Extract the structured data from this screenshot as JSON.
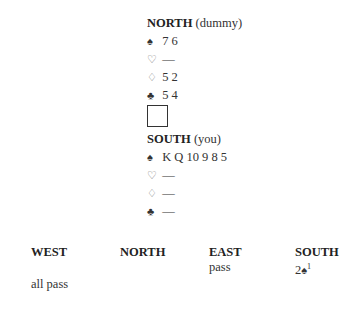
{
  "north": {
    "label": "NORTH",
    "note": "(dummy)",
    "spades": "7 6",
    "hearts": "—",
    "diamonds": "5 2",
    "clubs": "5 4"
  },
  "south": {
    "label": "SOUTH",
    "note": "(you)",
    "spades": "K Q 10 9 8 5",
    "hearts": "—",
    "diamonds": "—",
    "clubs": "—"
  },
  "suits": {
    "spade": "♠",
    "heart": "♡",
    "diamond": "♢",
    "club": "♣"
  },
  "auction": {
    "headers": [
      "WEST",
      "NORTH",
      "EAST",
      "SOUTH"
    ],
    "row1": {
      "east": "pass",
      "south_level": "2",
      "south_suit": "♠",
      "south_footnote": "1"
    },
    "row2": {
      "west": "all pass"
    }
  }
}
